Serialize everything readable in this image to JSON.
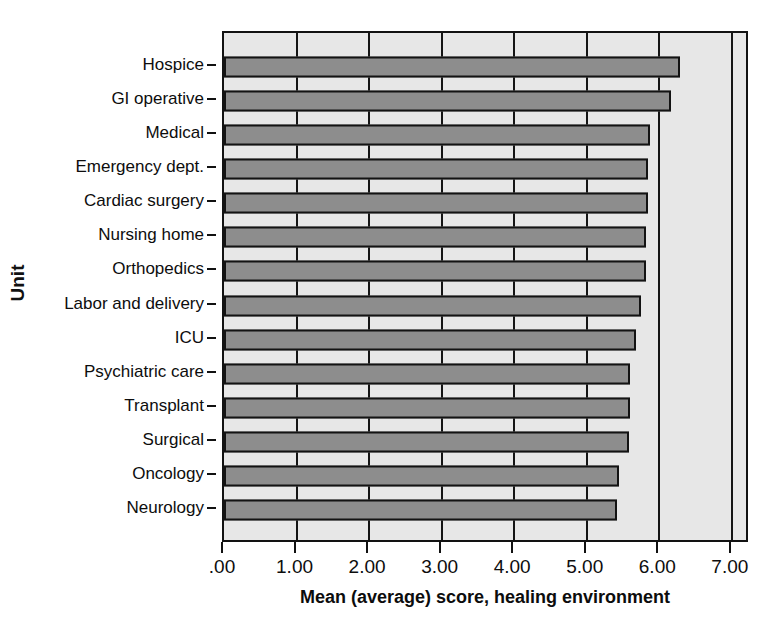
{
  "chart_data": {
    "type": "bar",
    "orientation": "horizontal",
    "title": "",
    "xlabel": "Mean (average) score, healing environment",
    "ylabel": "Unit",
    "xlim": [
      0,
      7.25
    ],
    "xticks": [
      0,
      1,
      2,
      3,
      4,
      5,
      6,
      7
    ],
    "xticklabels": [
      ".00",
      "1.00",
      "2.00",
      "3.00",
      "4.00",
      "5.00",
      "6.00",
      "7.00"
    ],
    "grid": true,
    "legend": null,
    "categories": [
      "Hospice",
      "GI operative",
      "Medical",
      "Emergency dept.",
      "Cardiac surgery",
      "Nursing home",
      "Orthopedics",
      "Labor and delivery",
      "ICU",
      "Psychiatric care",
      "Transplant",
      "Surgical",
      "Oncology",
      "Neurology"
    ],
    "values": [
      6.28,
      6.16,
      5.87,
      5.84,
      5.84,
      5.82,
      5.81,
      5.75,
      5.68,
      5.6,
      5.59,
      5.58,
      5.45,
      5.42
    ],
    "bar_color": "#8d8d8d",
    "bar_edge_color": "#131313",
    "panel_background": "#e7e7e7"
  },
  "axes": {
    "y_title": "Unit",
    "x_title": "Mean (average) score, healing environment"
  }
}
